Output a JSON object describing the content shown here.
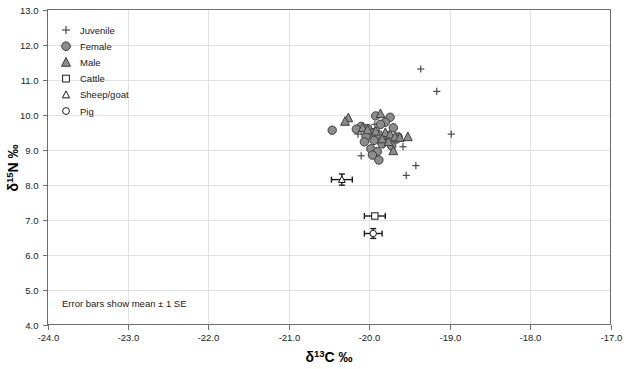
{
  "chart_data": {
    "type": "scatter",
    "title": "",
    "xlabel": "δ13C ‰",
    "ylabel": "δ15N ‰",
    "xlim": [
      -24.0,
      -17.0
    ],
    "ylim": [
      4.0,
      13.0
    ],
    "xticks": [
      "-24.0",
      "-23.0",
      "-22.0",
      "-21.0",
      "-20.0",
      "-19.0",
      "-18.0",
      "-17.0"
    ],
    "yticks": [
      "4.0",
      "5.0",
      "6.0",
      "7.0",
      "8.0",
      "9.0",
      "10.0",
      "11.0",
      "12.0",
      "13.0"
    ],
    "xtick_values": [
      -24.0,
      -23.0,
      -22.0,
      -21.0,
      -20.0,
      -19.0,
      -18.0,
      -17.0
    ],
    "ytick_values": [
      4.0,
      5.0,
      6.0,
      7.0,
      8.0,
      9.0,
      10.0,
      11.0,
      12.0,
      13.0
    ],
    "grid": true,
    "grid_color": "#e2e2e2",
    "legend_position": "top-left",
    "annotation": "Error bars show mean ± 1 SE",
    "marker_fill": "#8c8c8c",
    "marker_stroke": "#3d3d3d",
    "series": [
      {
        "name": "Juvenile",
        "marker": "plus",
        "fill": "none",
        "stroke": "#4a4a4a",
        "points": [
          [
            -19.36,
            11.3
          ],
          [
            -19.16,
            10.66
          ],
          [
            -19.93,
            9.72
          ],
          [
            -19.88,
            9.62
          ],
          [
            -19.98,
            9.6
          ],
          [
            -20.1,
            9.52
          ],
          [
            -20.14,
            9.44
          ],
          [
            -19.9,
            9.38
          ],
          [
            -19.76,
            9.36
          ],
          [
            -18.98,
            9.44
          ],
          [
            -19.86,
            9.26
          ],
          [
            -19.7,
            9.2
          ],
          [
            -19.82,
            9.14
          ],
          [
            -19.58,
            9.08
          ],
          [
            -19.42,
            8.54
          ],
          [
            -20.1,
            8.82
          ],
          [
            -19.54,
            8.26
          ]
        ]
      },
      {
        "name": "Female",
        "marker": "circle-filled",
        "fill": "#8c8c8c",
        "stroke": "#3d3d3d",
        "points": [
          [
            -20.46,
            9.55
          ],
          [
            -19.92,
            9.96
          ],
          [
            -19.74,
            9.92
          ],
          [
            -19.8,
            9.78
          ],
          [
            -19.86,
            9.72
          ],
          [
            -20.1,
            9.66
          ],
          [
            -20.02,
            9.6
          ],
          [
            -19.7,
            9.62
          ],
          [
            -20.16,
            9.58
          ],
          [
            -19.96,
            9.46
          ],
          [
            -19.88,
            9.42
          ],
          [
            -20.04,
            9.38
          ],
          [
            -19.78,
            9.4
          ],
          [
            -19.64,
            9.36
          ],
          [
            -19.94,
            9.26
          ],
          [
            -20.06,
            9.22
          ],
          [
            -19.84,
            9.16
          ],
          [
            -19.72,
            9.1
          ],
          [
            -19.98,
            9.02
          ],
          [
            -19.9,
            8.94
          ],
          [
            -19.96,
            8.84
          ],
          [
            -19.88,
            8.7
          ],
          [
            -19.66,
            9.3
          ]
        ]
      },
      {
        "name": "Male",
        "marker": "triangle-filled",
        "fill": "#8c8c8c",
        "stroke": "#3d3d3d",
        "points": [
          [
            -20.26,
            9.9
          ],
          [
            -19.86,
            10.02
          ],
          [
            -20.3,
            9.8
          ],
          [
            -20.08,
            9.62
          ],
          [
            -20.02,
            9.56
          ],
          [
            -19.92,
            9.52
          ],
          [
            -19.8,
            9.48
          ],
          [
            -19.74,
            9.42
          ],
          [
            -19.68,
            9.36
          ],
          [
            -19.62,
            9.34
          ],
          [
            -19.52,
            9.36
          ],
          [
            -19.84,
            9.3
          ],
          [
            -19.76,
            9.22
          ],
          [
            -19.7,
            8.96
          ]
        ]
      },
      {
        "name": "Cattle",
        "marker": "square-open",
        "fill": "#ffffff",
        "stroke": "#1a1a1a",
        "points": [
          [
            -19.93,
            7.1
          ]
        ],
        "error_x": 0.13,
        "error_y": 0.0
      },
      {
        "name": "Sheep/goat",
        "marker": "triangle-open",
        "fill": "#ffffff",
        "stroke": "#1a1a1a",
        "points": [
          [
            -20.34,
            8.14
          ]
        ],
        "error_x": 0.13,
        "error_y": 0.16
      },
      {
        "name": "Pig",
        "marker": "circle-open",
        "fill": "#ffffff",
        "stroke": "#1a1a1a",
        "points": [
          [
            -19.95,
            6.6
          ]
        ],
        "error_x": 0.11,
        "error_y": 0.14
      }
    ]
  },
  "legend": {
    "items": [
      {
        "label": "Juvenile",
        "marker": "plus"
      },
      {
        "label": "Female",
        "marker": "circle-filled"
      },
      {
        "label": "Male",
        "marker": "triangle-filled"
      },
      {
        "label": "Cattle",
        "marker": "square-open"
      },
      {
        "label": "Sheep/goat",
        "marker": "triangle-open"
      },
      {
        "label": "Pig",
        "marker": "circle-open"
      }
    ]
  },
  "axes": {
    "x_title_main": "C ‰",
    "x_title_delta": "δ",
    "x_title_sup": "13",
    "y_title_main": "N ‰",
    "y_title_delta": "δ",
    "y_title_sup": "15"
  },
  "note": {
    "text": "Error bars show mean ± 1 SE"
  }
}
